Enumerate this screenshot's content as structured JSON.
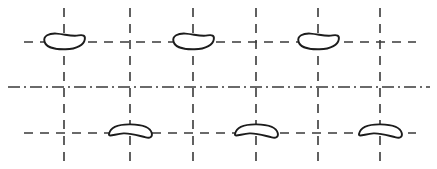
{
  "figure": {
    "canvas": {
      "width": 437,
      "height": 169
    },
    "background_color": "#ffffff",
    "line_color": "#3a3a3a",
    "shape_stroke_color": "#1c1c1c",
    "shape_fill_color": "#ffffff"
  },
  "grid": {
    "vertical_lines": [
      {
        "name": "vertical-line-1",
        "x": 64,
        "y1": 8,
        "y2": 161,
        "style": "dashed"
      },
      {
        "name": "vertical-line-2",
        "x": 130,
        "y1": 8,
        "y2": 161,
        "style": "dashed"
      },
      {
        "name": "vertical-line-3",
        "x": 193,
        "y1": 8,
        "y2": 161,
        "style": "dashed"
      },
      {
        "name": "vertical-line-4",
        "x": 256,
        "y1": 8,
        "y2": 161,
        "style": "dashed"
      },
      {
        "name": "vertical-line-5",
        "x": 318,
        "y1": 8,
        "y2": 161,
        "style": "dashed"
      },
      {
        "name": "vertical-line-6",
        "x": 380,
        "y1": 8,
        "y2": 161,
        "style": "dashed"
      }
    ],
    "horizontal_lines": [
      {
        "name": "horizontal-line-top",
        "y": 42,
        "x1": 24,
        "x2": 416,
        "style": "dashed"
      },
      {
        "name": "horizontal-line-center",
        "y": 87,
        "x1": 8,
        "x2": 430,
        "style": "dash-dot"
      },
      {
        "name": "horizontal-line-bottom",
        "y": 133,
        "x1": 24,
        "x2": 416,
        "style": "dashed"
      }
    ]
  },
  "elements": [
    {
      "name": "bean-top-1",
      "row": "top",
      "cx": 64,
      "cy": 42,
      "width": 41,
      "height": 15,
      "orientation": "concave-top"
    },
    {
      "name": "bean-top-2",
      "row": "top",
      "cx": 193,
      "cy": 42,
      "width": 41,
      "height": 15,
      "orientation": "concave-top"
    },
    {
      "name": "bean-top-3",
      "row": "top",
      "cx": 318,
      "cy": 42,
      "width": 41,
      "height": 15,
      "orientation": "concave-top"
    },
    {
      "name": "bean-bottom-1",
      "row": "bottom",
      "cx": 130,
      "cy": 133,
      "width": 43,
      "height": 16,
      "orientation": "convex-top"
    },
    {
      "name": "bean-bottom-2",
      "row": "bottom",
      "cx": 256,
      "cy": 133,
      "width": 43,
      "height": 16,
      "orientation": "convex-top"
    },
    {
      "name": "bean-bottom-3",
      "row": "bottom",
      "cx": 380,
      "cy": 133,
      "width": 43,
      "height": 16,
      "orientation": "convex-top"
    }
  ]
}
